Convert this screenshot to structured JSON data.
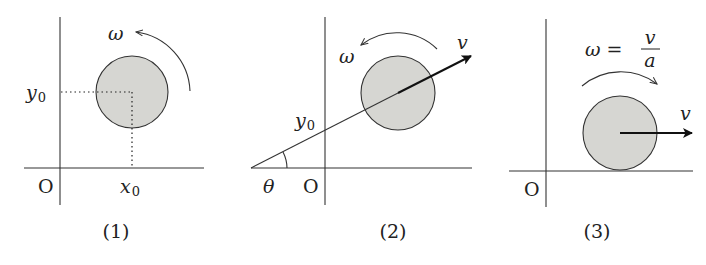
{
  "panels": [
    {
      "caption": "(1)",
      "origin_label": "O",
      "labels": {
        "omega": "ω",
        "y0_base": "y",
        "y0_sub": "0",
        "x0_base": "x",
        "x0_sub": "0"
      },
      "description": "Disk centered at (x0, y0) rotating counterclockwise with angular velocity ω"
    },
    {
      "caption": "(2)",
      "origin_label": "O",
      "labels": {
        "omega": "ω",
        "v": "v",
        "y0_base": "y",
        "y0_sub": "0",
        "theta": "θ"
      },
      "description": "Disk moving with velocity v along line at angle θ crossing y-axis at y0, rotating counterclockwise with ω"
    },
    {
      "caption": "(3)",
      "origin_label": "O",
      "labels": {
        "omega_eq": "ω =",
        "frac_num": "v",
        "frac_den": "a",
        "v": "v"
      },
      "description": "Disk rolling on the x-axis with velocity v, rotating clockwise with ω = v/a"
    }
  ],
  "colors": {
    "disk_fill": "#d6d6d2",
    "stroke": "#333333",
    "background": "#ffffff"
  }
}
